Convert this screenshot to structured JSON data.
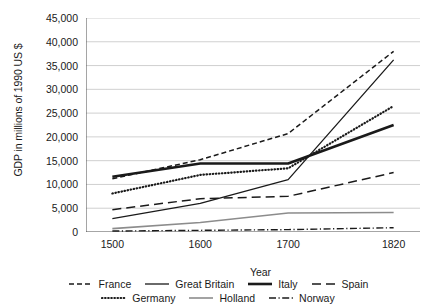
{
  "chart_data": {
    "type": "line",
    "title": "",
    "xlabel": "Year",
    "ylabel": "GDP in millions of 1990 US $",
    "x": [
      1500,
      1600,
      1700,
      1820
    ],
    "xticklabels": [
      "1500",
      "1600",
      "1700",
      "1820"
    ],
    "yticks": [
      0,
      5000,
      10000,
      15000,
      20000,
      25000,
      30000,
      35000,
      40000,
      45000
    ],
    "yticklabels": [
      "0",
      "5,000",
      "10,000",
      "15,000",
      "20,000",
      "25,000",
      "30,000",
      "35,000",
      "40,000",
      "45,000"
    ],
    "ylim": [
      0,
      45000
    ],
    "xlim": [
      1470,
      1850
    ],
    "grid": true,
    "legend_position": "bottom",
    "series": [
      {
        "name": "France",
        "style": "short-dash",
        "color": "#1a1a1a",
        "width": 1.5,
        "values": [
          11200,
          15200,
          20700,
          38000
        ]
      },
      {
        "name": "Great Britain",
        "style": "solid",
        "color": "#1a1a1a",
        "width": 1.3,
        "values": [
          2800,
          6000,
          11000,
          36200
        ]
      },
      {
        "name": "Italy",
        "style": "solid",
        "color": "#1a1a1a",
        "width": 2.6,
        "values": [
          11600,
          14400,
          14400,
          22500
        ]
      },
      {
        "name": "Spain",
        "style": "long-dash",
        "color": "#1a1a1a",
        "width": 1.5,
        "values": [
          4700,
          7000,
          7500,
          12500
        ]
      },
      {
        "name": "Germany",
        "style": "dotted",
        "color": "#1a1a1a",
        "width": 2.2,
        "values": [
          8100,
          12000,
          13400,
          26500
        ]
      },
      {
        "name": "Holland",
        "style": "solid",
        "color": "#8c8c8c",
        "width": 1.6,
        "values": [
          700,
          2000,
          4000,
          4100
        ]
      },
      {
        "name": "Norway",
        "style": "dash-dot",
        "color": "#1a1a1a",
        "width": 1.4,
        "values": [
          200,
          350,
          500,
          900
        ]
      }
    ]
  },
  "legend": {
    "row1": [
      "France",
      "Great Britain",
      "Italy",
      "Spain"
    ],
    "row2": [
      "Germany",
      "Holland",
      "Norway"
    ]
  }
}
